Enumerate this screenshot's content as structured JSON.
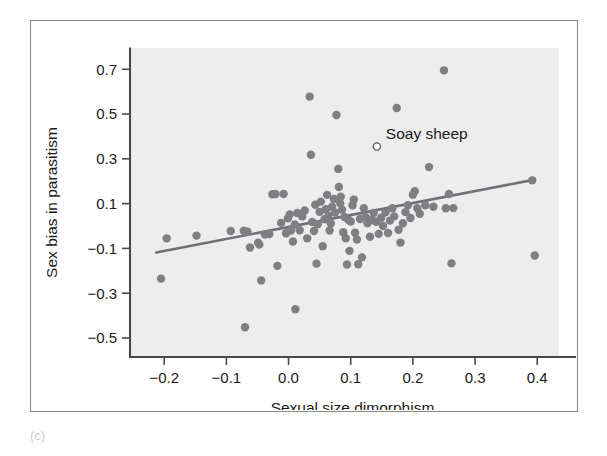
{
  "figure": {
    "panel_label": "(c)",
    "annotation": {
      "text": "Soay sheep",
      "x": 0.142,
      "y": 0.355
    }
  },
  "chart_data": {
    "type": "scatter",
    "title": "",
    "xlabel": "Sexual size dimorphism",
    "ylabel": "Sex bias in parasitism",
    "xlim": [
      -0.255,
      0.435
    ],
    "ylim": [
      -0.585,
      0.795
    ],
    "xticks": [
      -0.2,
      -0.1,
      0.0,
      0.1,
      0.2,
      0.3,
      0.4
    ],
    "xticklabels": [
      "−0.2",
      "−0.1",
      "0.0",
      "0.1",
      "0.2",
      "0.3",
      "0.4"
    ],
    "yticks": [
      0.7,
      0.5,
      0.3,
      0.1,
      -0.1,
      -0.3,
      -0.5
    ],
    "yticklabels": [
      "0.7",
      "0.5",
      "0.3",
      "0.1",
      "−0.1",
      "−0.3",
      "−0.5"
    ],
    "grid": false,
    "legend": null,
    "plot_background": "#ededed",
    "marker_color": "#7e7e83",
    "trendline": {
      "type": "linear",
      "color": "#6f6f75",
      "x_start": -0.213,
      "y_start": -0.118,
      "x_end": 0.392,
      "y_end": 0.205
    },
    "highlight": {
      "label": "Soay sheep",
      "x": 0.142,
      "y": 0.355,
      "marker": "open-circle"
    },
    "points": [
      [
        -0.205,
        -0.235
      ],
      [
        -0.196,
        -0.055
      ],
      [
        -0.148,
        -0.043
      ],
      [
        -0.093,
        -0.022
      ],
      [
        -0.072,
        -0.021
      ],
      [
        -0.066,
        -0.025
      ],
      [
        -0.07,
        -0.452
      ],
      [
        -0.062,
        -0.096
      ],
      [
        -0.049,
        -0.075
      ],
      [
        -0.047,
        -0.083
      ],
      [
        -0.044,
        -0.243
      ],
      [
        -0.038,
        -0.038
      ],
      [
        -0.031,
        -0.036
      ],
      [
        -0.026,
        0.142
      ],
      [
        -0.021,
        0.143
      ],
      [
        -0.018,
        -0.178
      ],
      [
        -0.012,
        0.014
      ],
      [
        -0.008,
        0.143
      ],
      [
        -0.004,
        -0.032
      ],
      [
        -0.001,
        0.034
      ],
      [
        0.002,
        0.052
      ],
      [
        0.004,
        -0.02
      ],
      [
        0.007,
        -0.069
      ],
      [
        0.01,
        0.007
      ],
      [
        0.011,
        -0.372
      ],
      [
        0.014,
        0.058
      ],
      [
        0.018,
        -0.019
      ],
      [
        0.022,
        0.043
      ],
      [
        0.026,
        0.069
      ],
      [
        0.03,
        -0.055
      ],
      [
        0.034,
        0.578
      ],
      [
        0.036,
        0.318
      ],
      [
        0.038,
        0.018
      ],
      [
        0.041,
        -0.022
      ],
      [
        0.043,
        0.095
      ],
      [
        0.045,
        -0.168
      ],
      [
        0.047,
        0.008
      ],
      [
        0.05,
        0.063
      ],
      [
        0.052,
        0.109
      ],
      [
        0.055,
        -0.09
      ],
      [
        0.058,
        0.03
      ],
      [
        0.06,
        0.075
      ],
      [
        0.062,
        0.139
      ],
      [
        0.064,
        0.046
      ],
      [
        0.066,
        -0.02
      ],
      [
        0.068,
        0.011
      ],
      [
        0.07,
        0.086
      ],
      [
        0.073,
        0.121
      ],
      [
        0.075,
        0.06
      ],
      [
        0.077,
        0.496
      ],
      [
        0.08,
        0.255
      ],
      [
        0.081,
        0.174
      ],
      [
        0.083,
        0.101
      ],
      [
        0.084,
        0.131
      ],
      [
        0.086,
        0.073
      ],
      [
        0.088,
        -0.028
      ],
      [
        0.09,
        0.04
      ],
      [
        0.092,
        -0.055
      ],
      [
        0.094,
        -0.172
      ],
      [
        0.096,
        0.028
      ],
      [
        0.098,
        -0.111
      ],
      [
        0.1,
        0.02
      ],
      [
        0.103,
        0.093
      ],
      [
        0.105,
        0.118
      ],
      [
        0.107,
        -0.03
      ],
      [
        0.11,
        -0.06
      ],
      [
        0.112,
        -0.171
      ],
      [
        0.115,
        0.031
      ],
      [
        0.118,
        -0.14
      ],
      [
        0.121,
        0.08
      ],
      [
        0.124,
        0.039
      ],
      [
        0.127,
        0.012
      ],
      [
        0.131,
        -0.048
      ],
      [
        0.134,
        0.027
      ],
      [
        0.137,
        0.058
      ],
      [
        0.141,
        0.019
      ],
      [
        0.145,
        -0.035
      ],
      [
        0.149,
        0.037
      ],
      [
        0.152,
        0.0
      ],
      [
        0.156,
        0.061
      ],
      [
        0.16,
        -0.031
      ],
      [
        0.163,
        0.024
      ],
      [
        0.167,
        0.079
      ],
      [
        0.17,
        0.043
      ],
      [
        0.174,
        0.527
      ],
      [
        0.177,
        -0.017
      ],
      [
        0.18,
        -0.074
      ],
      [
        0.184,
        0.012
      ],
      [
        0.188,
        0.062
      ],
      [
        0.192,
        0.093
      ],
      [
        0.196,
        0.036
      ],
      [
        0.2,
        0.14
      ],
      [
        0.203,
        0.155
      ],
      [
        0.207,
        0.079
      ],
      [
        0.211,
        0.055
      ],
      [
        0.22,
        0.093
      ],
      [
        0.226,
        0.263
      ],
      [
        0.233,
        0.086
      ],
      [
        0.25,
        0.695
      ],
      [
        0.253,
        0.079
      ],
      [
        0.258,
        0.143
      ],
      [
        0.262,
        -0.167
      ],
      [
        0.265,
        0.08
      ],
      [
        0.392,
        0.204
      ],
      [
        0.396,
        -0.132
      ]
    ]
  }
}
